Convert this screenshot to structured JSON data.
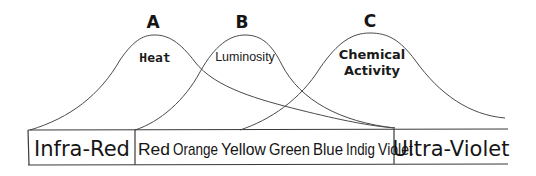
{
  "curves": [
    {
      "letter": "A",
      "label": "Heat"
    },
    {
      "letter": "B",
      "label": "Luminosity"
    },
    {
      "letter": "C",
      "label_line1": "Chemical",
      "label_line2": "Activity"
    }
  ],
  "bands": {
    "infrared": "Infra-Red",
    "visible": [
      "Red",
      "Orange",
      "Yellow",
      "Green",
      "Blue",
      "Indig",
      "Violet"
    ],
    "ultraviolet": "Ultra-Violet"
  },
  "colors": {
    "ink": "#1a1a1a",
    "paper": "#ffffff"
  }
}
